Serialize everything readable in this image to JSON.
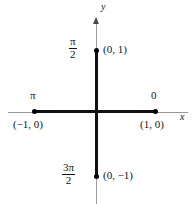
{
  "figure": {
    "type": "coordinate-diagram",
    "background": "#ffffff",
    "axis_color": "#9b9b9b",
    "segment_color": "#111111",
    "point_color": "#000000",
    "axes": {
      "x_label": "x",
      "y_label": "y"
    },
    "angle_labels": {
      "right": "0",
      "top_numerator": "π",
      "top_denominator": "2",
      "left": "π",
      "bottom_numerator": "3π",
      "bottom_denominator": "2"
    },
    "coordinate_labels": {
      "right": "(1, 0)",
      "top": "(0, 1)",
      "left": "(−1, 0)",
      "bottom": "(0, −1)"
    }
  },
  "chart_data": {
    "type": "scatter",
    "title": "",
    "xlabel": "x",
    "ylabel": "y",
    "xlim": [
      -1.45,
      1.45
    ],
    "ylim": [
      -1.45,
      1.45
    ],
    "grid": false,
    "legend": null,
    "points": [
      {
        "x": 1,
        "y": 0,
        "coord_label": "(1, 0)",
        "angle_label": "0"
      },
      {
        "x": 0,
        "y": 1,
        "coord_label": "(0, 1)",
        "angle_label": "π/2"
      },
      {
        "x": -1,
        "y": 0,
        "coord_label": "(−1, 0)",
        "angle_label": "π"
      },
      {
        "x": 0,
        "y": -1,
        "coord_label": "(0, −1)",
        "angle_label": "3π/2"
      }
    ],
    "segments": [
      {
        "from": [
          -1,
          0
        ],
        "to": [
          1,
          0
        ]
      },
      {
        "from": [
          0,
          1
        ],
        "to": [
          0,
          -1
        ]
      }
    ]
  }
}
